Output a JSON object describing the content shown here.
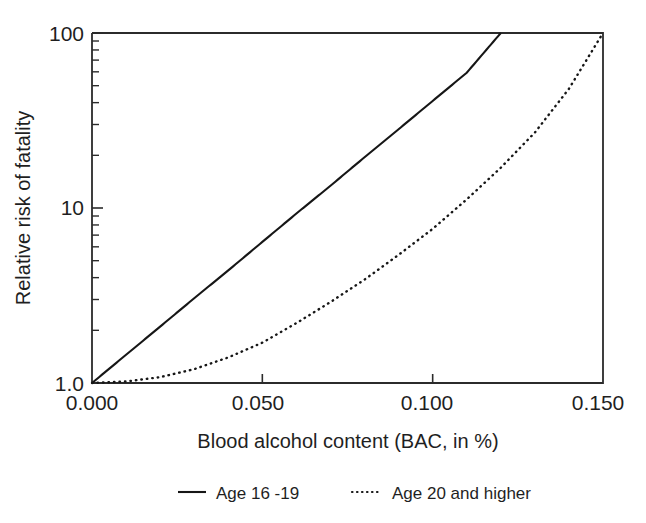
{
  "chart_data": {
    "type": "line",
    "title": "",
    "xlabel": "Blood alcohol content (BAC, in %)",
    "ylabel": "Relative risk of fatality",
    "xlim": [
      0.0,
      0.15
    ],
    "ylim": [
      1.0,
      100.0
    ],
    "yscale": "log",
    "xscale": "linear",
    "grid": false,
    "legend_position": "below-plot",
    "xticks": [
      0.0,
      0.05,
      0.1,
      0.15
    ],
    "xtick_labels": [
      "0.000",
      "0.050",
      "0.100",
      "0.150"
    ],
    "yticks": [
      1.0,
      10.0,
      100.0
    ],
    "ytick_labels": [
      "1.0",
      "10",
      "100"
    ],
    "y_minor_ticks": [
      2,
      3,
      4,
      5,
      6,
      7,
      8,
      9,
      20,
      30,
      40,
      50,
      60,
      70,
      80,
      90
    ],
    "series": [
      {
        "name": "Age 16 -19",
        "style": "solid",
        "color": "#161616",
        "x": [
          0.0,
          0.01,
          0.02,
          0.03,
          0.04,
          0.05,
          0.06,
          0.07,
          0.08,
          0.09,
          0.1,
          0.11,
          0.12
        ],
        "values": [
          1.0,
          1.45,
          2.1,
          3.05,
          4.4,
          6.4,
          9.3,
          13.4,
          19.5,
          28.2,
          40.9,
          59.3,
          100.0
        ]
      },
      {
        "name": "Age 20 and higher",
        "style": "dotted",
        "color": "#161616",
        "x": [
          0.0,
          0.01,
          0.02,
          0.03,
          0.04,
          0.05,
          0.06,
          0.07,
          0.08,
          0.09,
          0.1,
          0.11,
          0.12,
          0.13,
          0.14,
          0.15
        ],
        "values": [
          1.0,
          1.02,
          1.08,
          1.2,
          1.4,
          1.7,
          2.2,
          2.9,
          3.9,
          5.4,
          7.6,
          11.2,
          17.0,
          27.0,
          48.0,
          100.0
        ]
      }
    ],
    "legend": [
      {
        "label": "Age 16 -19",
        "style": "solid"
      },
      {
        "label": "Age 20 and higher",
        "style": "dotted"
      }
    ]
  },
  "axes": {
    "x_title": "Blood alcohol content (BAC, in %)",
    "y_title": "Relative risk of fatality",
    "x_tick_labels": [
      "0.000",
      "0.050",
      "0.100",
      "0.150"
    ],
    "y_tick_labels": [
      "100",
      "10",
      "1.0"
    ]
  },
  "legend": {
    "entry_1_label": "Age 16 -19",
    "entry_2_label": "Age 20 and higher"
  },
  "colors": {
    "background": "#ffffff",
    "axis": "#2b2b2b",
    "series": "#161616",
    "text": "#1f1f1f"
  }
}
